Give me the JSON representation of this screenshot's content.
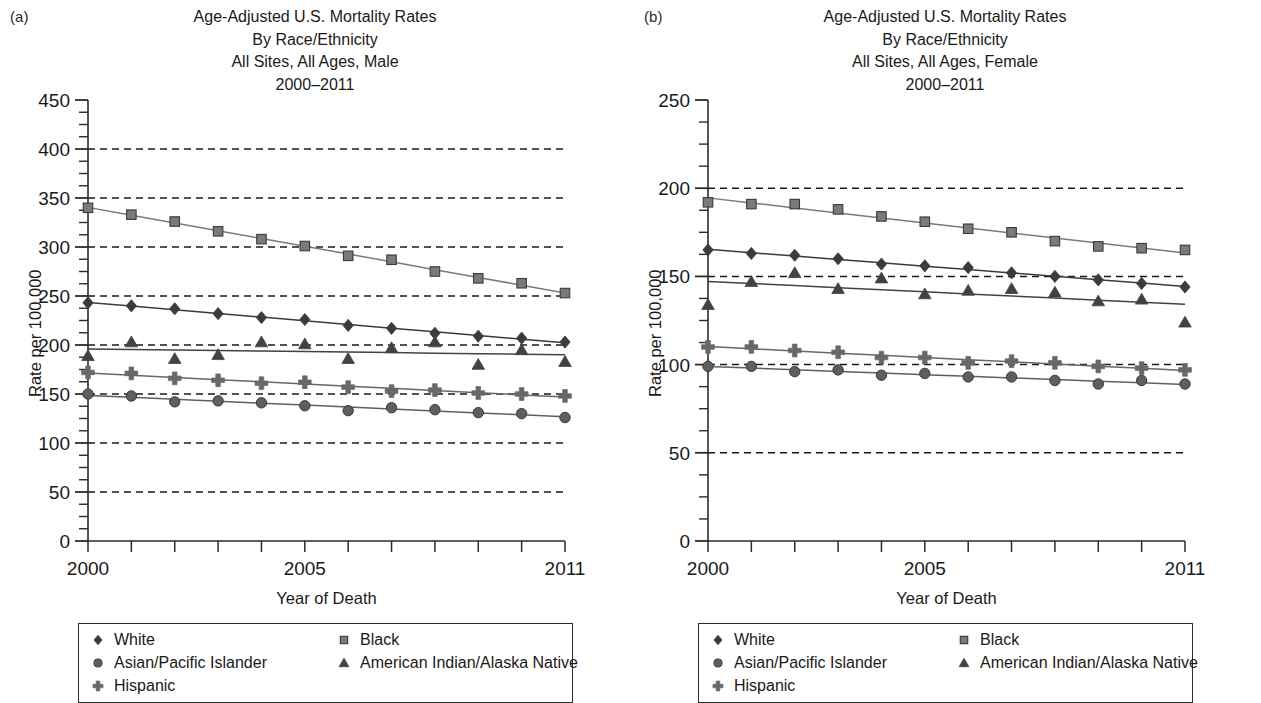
{
  "figure": {
    "background": "#ffffff",
    "ink": "#1d1d1d"
  },
  "panels": [
    {
      "letter": "(a)",
      "title_lines": [
        "Age-Adjusted U.S. Mortality Rates",
        "By Race/Ethnicity",
        "All Sites, All Ages, Male",
        "2000–2011"
      ],
      "chart_key": 0
    },
    {
      "letter": "(b)",
      "title_lines": [
        "Age-Adjusted U.S. Mortality Rates",
        "By Race/Ethnicity",
        "All Sites, All Ages, Female",
        "2000–2011"
      ],
      "chart_key": 1
    }
  ],
  "legend": {
    "entries": [
      {
        "label": "White",
        "marker": "diamond-marker",
        "color": "#3b3b3b"
      },
      {
        "label": "Black",
        "marker": "square-marker",
        "color": "#7a7a7a"
      },
      {
        "label": "Asian/Pacific Islander",
        "marker": "circle-marker",
        "color": "#5f5f5f"
      },
      {
        "label": "American Indian/Alaska Native",
        "marker": "triangle-marker",
        "color": "#424242"
      },
      {
        "label": "Hispanic",
        "marker": "plus-marker",
        "color": "#686868"
      }
    ]
  },
  "chart_data": [
    {
      "type": "line",
      "title": "Age-Adjusted U.S. Mortality Rates By Race/Ethnicity All Sites, All Ages, Male 2000–2011",
      "panel": "(a)",
      "xlabel": "Year of Death",
      "ylabel": "Rate per 100,000",
      "x": [
        2000,
        2001,
        2002,
        2003,
        2004,
        2005,
        2006,
        2007,
        2008,
        2009,
        2010,
        2011
      ],
      "xtick_labels": [
        "2000",
        "",
        "",
        "",
        "",
        "2005",
        "",
        "",
        "",
        "",
        "",
        "2011"
      ],
      "xlim": [
        2000,
        2011
      ],
      "ylim": [
        0,
        450
      ],
      "ytick_major": [
        0,
        50,
        100,
        150,
        200,
        250,
        300,
        350,
        400,
        450
      ],
      "ytick_minor_step": 12.5,
      "gridlines": [
        50,
        100,
        150,
        200,
        250,
        300,
        350,
        400
      ],
      "grid": "dashed-horizontal",
      "legend_position": "below",
      "series": [
        {
          "name": "White",
          "marker": "diamond-marker",
          "color": "#3b3b3b",
          "values": [
            243,
            240,
            237,
            232,
            228,
            226,
            220,
            217,
            212,
            209,
            207,
            203
          ]
        },
        {
          "name": "Black",
          "marker": "square-marker",
          "color": "#7a7a7a",
          "values": [
            340,
            333,
            326,
            316,
            308,
            301,
            291,
            287,
            275,
            268,
            263,
            253
          ]
        },
        {
          "name": "Asian/Pacific Islander",
          "marker": "circle-marker",
          "color": "#5f5f5f",
          "values": [
            150,
            148,
            142,
            143,
            141,
            138,
            133,
            136,
            134,
            131,
            130,
            126
          ]
        },
        {
          "name": "American Indian/Alaska Native",
          "marker": "triangle-marker",
          "color": "#424242",
          "values": [
            189,
            203,
            186,
            190,
            203,
            201,
            186,
            197,
            203,
            180,
            195,
            183
          ]
        },
        {
          "name": "Hispanic",
          "marker": "plus-marker",
          "color": "#686868",
          "values": [
            172,
            171,
            166,
            164,
            161,
            162,
            157,
            153,
            154,
            151,
            150,
            148
          ]
        }
      ]
    },
    {
      "type": "line",
      "title": "Age-Adjusted U.S. Mortality Rates By Race/Ethnicity All Sites, All Ages, Female 2000–2011",
      "panel": "(b)",
      "xlabel": "Year of Death",
      "ylabel": "Rate per 100,000",
      "x": [
        2000,
        2001,
        2002,
        2003,
        2004,
        2005,
        2006,
        2007,
        2008,
        2009,
        2010,
        2011
      ],
      "xtick_labels": [
        "2000",
        "",
        "",
        "",
        "",
        "2005",
        "",
        "",
        "",
        "",
        "",
        "2011"
      ],
      "xlim": [
        2000,
        2011
      ],
      "ylim": [
        0,
        250
      ],
      "ytick_major": [
        0,
        50,
        100,
        150,
        200,
        250
      ],
      "ytick_minor_step": 12.5,
      "gridlines": [
        50,
        100,
        150,
        200
      ],
      "grid": "dashed-horizontal",
      "legend_position": "below",
      "series": [
        {
          "name": "White",
          "marker": "diamond-marker",
          "color": "#3b3b3b",
          "values": [
            165,
            163,
            162,
            160,
            157,
            156,
            155,
            152,
            150,
            148,
            146,
            144
          ]
        },
        {
          "name": "Black",
          "marker": "square-marker",
          "color": "#7a7a7a",
          "values": [
            192,
            191,
            191,
            188,
            184,
            181,
            177,
            175,
            170,
            167,
            166,
            165
          ]
        },
        {
          "name": "Asian/Pacific Islander",
          "marker": "circle-marker",
          "color": "#5f5f5f",
          "values": [
            99,
            99,
            96,
            97,
            94,
            95,
            93,
            93,
            91,
            89,
            91,
            89
          ]
        },
        {
          "name": "American Indian/Alaska Native",
          "marker": "triangle-marker",
          "color": "#424242",
          "values": [
            134,
            147,
            152,
            143,
            149,
            140,
            142,
            143,
            141,
            136,
            137,
            124
          ]
        },
        {
          "name": "Hispanic",
          "marker": "plus-marker",
          "color": "#686868",
          "values": [
            110,
            110,
            108,
            107,
            104,
            104,
            101,
            102,
            101,
            99,
            98,
            97
          ]
        }
      ]
    }
  ]
}
